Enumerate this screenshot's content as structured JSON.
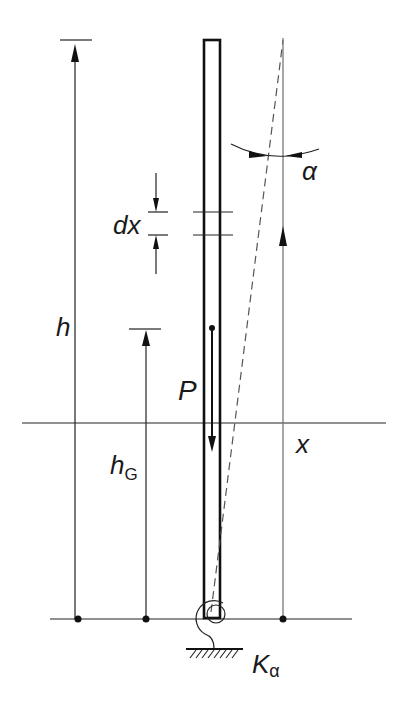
{
  "diagram": {
    "type": "inverted pendulum column with rotational spring base",
    "labels": {
      "h": "h",
      "h_G": "h",
      "h_G_sub": "G",
      "dx": "dx",
      "P": "P",
      "x": "x",
      "alpha": "α",
      "K": "K",
      "K_sub": "α"
    },
    "elements": [
      "column",
      "dashed deflected axis",
      "height dimension h",
      "centre of gravity height h_G",
      "load P",
      "element dx",
      "coordinate x",
      "rotation angle alpha",
      "rotational spring K_alpha",
      "ground"
    ]
  }
}
